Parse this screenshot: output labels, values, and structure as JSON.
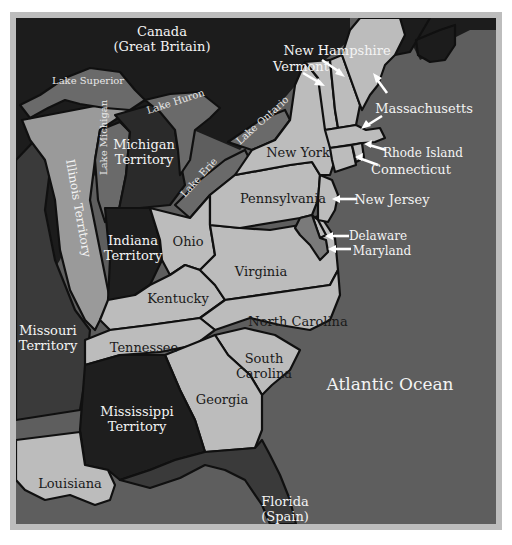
{
  "map": {
    "colors": {
      "background": "#ffffff",
      "frame": "#bdbdbd",
      "ocean": "#5e5e5e",
      "canada": "#1c1c1c",
      "states": "#bcbcbc",
      "territories_light": "#9a9a9a",
      "territories_dark": "#1e1e1e",
      "lakes": "#6a6a6a",
      "foreign": "#3a3a3a",
      "border": "#101010",
      "label_dark": "#1a1a1a",
      "label_light": "#f4f4f4"
    },
    "labels": {
      "canada_line1": "Canada",
      "canada_line2": "(Great Britain)",
      "lake_superior": "Lake Superior",
      "lake_huron": "Lake Huron",
      "lake_michigan": "Lake Michigan",
      "lake_erie": "Lake Erie",
      "lake_ontario": "Lake Ontario",
      "illinois_territory": "Illinois Territory",
      "michigan_territory_line1": "Michigan",
      "michigan_territory_line2": "Territory",
      "indiana_territory_line1": "Indiana",
      "indiana_territory_line2": "Territory",
      "missouri_territory_line1": "Missouri",
      "missouri_territory_line2": "Territory",
      "mississippi_territory_line1": "Mississippi",
      "mississippi_territory_line2": "Territory",
      "ohio": "Ohio",
      "kentucky": "Kentucky",
      "tennessee": "Tennessee",
      "virginia": "Virginia",
      "pennsylvania": "Pennsylvania",
      "new_york": "New York",
      "north_carolina": "North Carolina",
      "south_carolina_line1": "South",
      "south_carolina_line2": "Carolina",
      "georgia": "Georgia",
      "louisiana": "Louisiana",
      "florida_line1": "Florida",
      "florida_line2": "(Spain)",
      "atlantic_ocean": "Atlantic Ocean",
      "new_hampshire": "New Hampshire",
      "vermont": "Vermont",
      "massachusetts": "Massachusetts",
      "rhode_island": "Rhode Island",
      "connecticut": "Connecticut",
      "new_jersey": "New Jersey",
      "delaware": "Delaware",
      "maryland": "Maryland"
    }
  }
}
